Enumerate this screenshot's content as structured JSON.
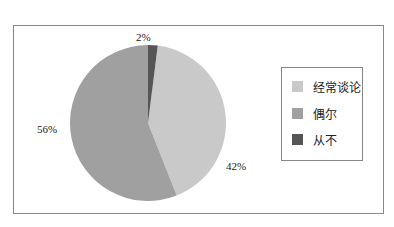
{
  "header": {
    "title_cut": ""
  },
  "chart_data": {
    "type": "pie",
    "title": "",
    "categories": [
      "经常谈论",
      "偶尔",
      "从不"
    ],
    "values": [
      42,
      56,
      2
    ],
    "labels": [
      "42%",
      "56%",
      "2%"
    ],
    "colors": [
      "#c9c9c9",
      "#a0a0a0",
      "#555555"
    ],
    "legend_position": "right"
  },
  "legend": {
    "items": [
      {
        "label": "经常谈论",
        "color": "#c9c9c9"
      },
      {
        "label": "偶尔",
        "color": "#a0a0a0"
      },
      {
        "label": "从不",
        "color": "#555555"
      }
    ]
  }
}
